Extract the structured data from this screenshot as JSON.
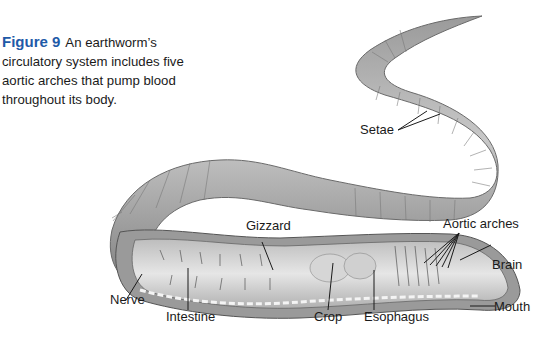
{
  "caption": {
    "figure_label": "Figure 9",
    "text": "An earthworm’s circulatory system includes five aortic arches that pump blood throughout its body."
  },
  "illustration": {
    "subject": "earthworm cutaway",
    "labels": {
      "setae": "Setae",
      "gizzard": "Gizzard",
      "aortic_arches": "Aortic arches",
      "brain": "Brain",
      "nerve": "Nerve",
      "intestine": "Intestine",
      "crop": "Crop",
      "esophagus": "Esophagus",
      "mouth": "Mouth"
    }
  }
}
